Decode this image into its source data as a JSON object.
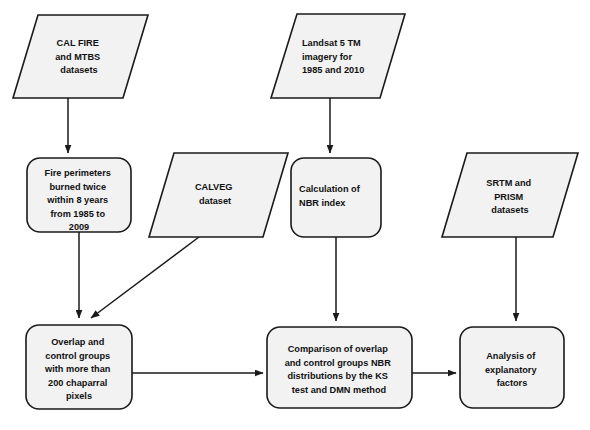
{
  "diagram": {
    "type": "flowchart",
    "background_color": "#ffffff",
    "node_fill_color": "#f2f2f2",
    "node_stroke_color": "#1a1a1a",
    "text_color": "#111111"
  },
  "nodes": [
    {
      "id": "cal_fire_mtbs",
      "shape": "parallelogram",
      "role": "data-input",
      "text": "CAL FIRE and MTBS datasets",
      "lines": [
        "CAL FIRE",
        "and MTBS",
        "datasets"
      ],
      "align": "center"
    },
    {
      "id": "landsat",
      "shape": "parallelogram",
      "role": "data-input",
      "text": "Landsat 5 TM imagery for 1985 and 2010",
      "lines": [
        "Landsat 5 TM",
        "imagery for",
        "1985 and 2010"
      ],
      "align": "left"
    },
    {
      "id": "fire_perimeters",
      "shape": "rounded-rectangle",
      "role": "process",
      "text": "Fire perimeters burned twice within 8 years from 1985 to 2009",
      "lines": [
        "Fire perimeters",
        "burned twice",
        "within 8 years",
        "from 1985 to",
        "2009"
      ],
      "align": "center"
    },
    {
      "id": "calveg",
      "shape": "parallelogram",
      "role": "data-input",
      "text": "CALVEG dataset",
      "lines": [
        "CALVEG",
        "dataset"
      ],
      "align": "center"
    },
    {
      "id": "nbr_index",
      "shape": "rounded-rectangle",
      "role": "process",
      "text": "Calculation of NBR index",
      "lines": [
        "Calculation of",
        "NBR index"
      ],
      "align": "left"
    },
    {
      "id": "srtm_prism",
      "shape": "parallelogram",
      "role": "data-input",
      "text": "SRTM and PRISM datasets",
      "lines": [
        "SRTM and",
        "PRISM",
        "datasets"
      ],
      "align": "center"
    },
    {
      "id": "overlap_control",
      "shape": "rounded-rectangle",
      "role": "process",
      "text": "Overlap and control groups with more than 200 chaparral pixels",
      "lines": [
        "Overlap and",
        "control groups",
        "with more than",
        "200 chaparral",
        "pixels"
      ],
      "align": "center"
    },
    {
      "id": "comparison",
      "shape": "rounded-rectangle",
      "role": "process",
      "text": "Comparison of overlap and control groups NBR distributions by the KS test and DMN method",
      "lines": [
        "Comparison of overlap",
        "and control groups NBR",
        "distributions by the KS",
        "test and DMN method"
      ],
      "align": "center"
    },
    {
      "id": "analysis",
      "shape": "rounded-rectangle",
      "role": "process",
      "text": "Analysis of explanatory factors",
      "lines": [
        "Analysis of",
        "explanatory",
        "factors"
      ],
      "align": "center"
    }
  ],
  "edges": [
    {
      "id": "e1",
      "from": "cal_fire_mtbs",
      "to": "fire_perimeters",
      "style": "straight-vertical",
      "arrow": true
    },
    {
      "id": "e2",
      "from": "landsat",
      "to": "nbr_index",
      "style": "straight-vertical",
      "arrow": true
    },
    {
      "id": "e3",
      "from": "fire_perimeters",
      "to": "overlap_control",
      "style": "straight-vertical",
      "arrow": true
    },
    {
      "id": "e4",
      "from": "calveg",
      "to": "overlap_control",
      "style": "diagonal",
      "arrow": true
    },
    {
      "id": "e5",
      "from": "nbr_index",
      "to": "comparison",
      "style": "straight-vertical",
      "arrow": true
    },
    {
      "id": "e6",
      "from": "srtm_prism",
      "to": "analysis",
      "style": "straight-vertical",
      "arrow": true
    },
    {
      "id": "e7",
      "from": "overlap_control",
      "to": "comparison",
      "style": "straight-horizontal",
      "arrow": true
    },
    {
      "id": "e8",
      "from": "comparison",
      "to": "analysis",
      "style": "straight-horizontal",
      "arrow": true
    }
  ]
}
